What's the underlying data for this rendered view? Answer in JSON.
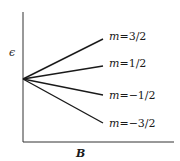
{
  "diagram": {
    "y_axis_label": "ϵ",
    "x_axis_label": "B",
    "lines": [
      {
        "label_var": "m",
        "label_eq": "=3/2",
        "end_y": 39
      },
      {
        "label_var": "m",
        "label_eq": "=1/2",
        "end_y": 66
      },
      {
        "label_var": "m",
        "label_eq": "=−1/2",
        "end_y": 95
      },
      {
        "label_var": "m",
        "label_eq": "=−3/2",
        "end_y": 123
      }
    ],
    "colors": {
      "line": "#1a1a1a",
      "axis": "#333333",
      "background": "#ffffff"
    }
  }
}
